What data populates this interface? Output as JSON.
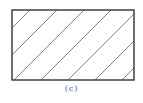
{
  "figure": {
    "caption": "(c)",
    "rect": {
      "x": 12,
      "y": 10,
      "width": 122,
      "height": 70
    },
    "stroke_color": "#333333",
    "hatch_color": "#666666",
    "hatch": {
      "angle_deg": 45,
      "spacing_px": 27,
      "top_x": [
        26,
        52,
        79,
        106,
        133
      ],
      "bottom_x": [
        -44,
        -17,
        9,
        36,
        63,
        90,
        117
      ]
    }
  }
}
